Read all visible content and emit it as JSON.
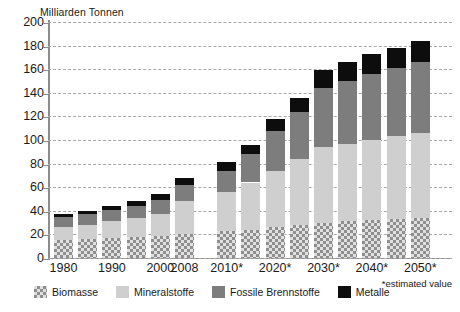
{
  "chart_data": {
    "type": "bar",
    "title": "",
    "subtitle": "",
    "ylabel": "Milliarden Tonnen",
    "xlabel": "",
    "ylim": [
      0,
      200
    ],
    "yticks": [
      0,
      20,
      40,
      60,
      80,
      100,
      120,
      140,
      160,
      180,
      200
    ],
    "grid": true,
    "stacked": true,
    "legend_position": "bottom-left",
    "footnote": "*estimated value",
    "categories": [
      "1980",
      "",
      "1990",
      "",
      "2000",
      "2008",
      "2010*",
      "",
      "2020*",
      "",
      "2030*",
      "",
      "2040*",
      "",
      "2050*"
    ],
    "tick_labels": [
      "1980",
      "1990",
      "2000",
      "2008",
      "2010*",
      "2020*",
      "2030*",
      "2040*",
      "2050*"
    ],
    "series": [
      {
        "name": "Biomasse",
        "color": "#e0e0e0",
        "pattern": "crosshatch",
        "values": [
          15,
          16,
          17,
          18,
          19,
          20,
          23,
          24,
          26,
          28,
          30,
          31,
          32,
          33,
          34
        ]
      },
      {
        "name": "Mineralstoffe",
        "color": "#cfcfcf",
        "pattern": "solid",
        "values": [
          11,
          12,
          14,
          16,
          18,
          28,
          33,
          40,
          48,
          56,
          64,
          66,
          68,
          70,
          72
        ]
      },
      {
        "name": "Fossile Brennstoffe",
        "color": "#7d7d7d",
        "pattern": "solid",
        "values": [
          9,
          9,
          10,
          10,
          12,
          14,
          18,
          24,
          34,
          40,
          50,
          53,
          56,
          58,
          60
        ]
      },
      {
        "name": "Metalle",
        "color": "#0d0d0d",
        "pattern": "solid",
        "values": [
          2,
          3,
          3,
          4,
          5,
          6,
          7,
          8,
          10,
          12,
          15,
          16,
          17,
          17,
          18
        ]
      }
    ],
    "totals": [
      37,
      40,
      44,
      48,
      54,
      68,
      81,
      96,
      118,
      136,
      159,
      166,
      173,
      178,
      184
    ]
  },
  "legend": {
    "items": [
      {
        "label": "Biomasse",
        "swatch": "crosshatch-swatch"
      },
      {
        "label": "Mineralstoffe",
        "swatch": "light-gray-swatch"
      },
      {
        "label": "Fossile Brennstoffe",
        "swatch": "mid-gray-swatch"
      },
      {
        "label": "Metalle",
        "swatch": "black-swatch"
      }
    ]
  }
}
